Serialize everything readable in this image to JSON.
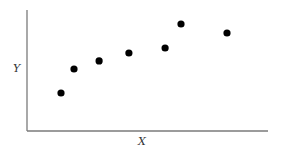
{
  "chart_data": {
    "type": "scatter",
    "title": "",
    "xlabel": "X",
    "ylabel": "Y",
    "xlim": [
      0,
      100
    ],
    "ylim": [
      0,
      100
    ],
    "grid": false,
    "legend": null,
    "ticks": "none",
    "series": [
      {
        "name": "points",
        "color": "#000000",
        "x": [
          14.1,
          19.5,
          29.9,
          42.3,
          57.3,
          63.9,
          83.0
        ],
        "y": [
          31.4,
          51.2,
          57.9,
          64.5,
          68.6,
          88.4,
          81.0
        ]
      }
    ]
  },
  "style": {
    "axis_color": "#7a7a7a",
    "point_color": "#000000",
    "point_radius": 3.6
  },
  "layout": {
    "plot_left": 27,
    "plot_right": 268,
    "plot_top": 10,
    "plot_bottom": 131
  }
}
